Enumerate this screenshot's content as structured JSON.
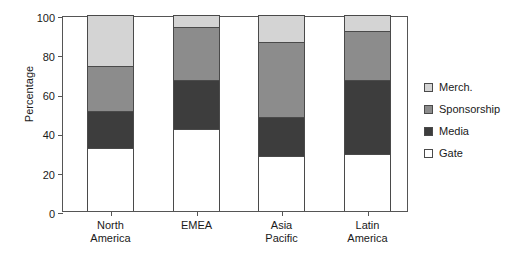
{
  "chart_data": {
    "type": "bar",
    "subtype": "stacked-bar",
    "title": "",
    "xlabel": "",
    "ylabel": "Percentage",
    "ylim": [
      0,
      100
    ],
    "yticks": [
      0,
      20,
      40,
      60,
      80,
      100
    ],
    "ytick_labels": [
      "0",
      "20",
      "40",
      "60",
      "80",
      "100"
    ],
    "grid": false,
    "legend_position": "right",
    "categories": [
      "North America",
      "EMEA",
      "Asia Pacific",
      "Latin America"
    ],
    "category_lines": [
      [
        "North",
        "America"
      ],
      [
        "EMEA",
        ""
      ],
      [
        "Asia",
        "Pacific"
      ],
      [
        "Latin",
        "America"
      ]
    ],
    "stack_order_bottom_to_top": [
      "Gate",
      "Media",
      "Sponsorship",
      "Merch."
    ],
    "series": [
      {
        "name": "Gate",
        "color": "#ffffff",
        "values": [
          32,
          42,
          28,
          29
        ]
      },
      {
        "name": "Media",
        "color": "#3d3d3d",
        "values": [
          19,
          25,
          20,
          38
        ]
      },
      {
        "name": "Sponsorship",
        "color": "#8c8c8c",
        "values": [
          23,
          27,
          38,
          25
        ]
      },
      {
        "name": "Merch.",
        "color": "#d4d4d4",
        "values": [
          26,
          6,
          14,
          8
        ]
      }
    ],
    "cumulative_tops": {
      "North America": {
        "Gate": 32,
        "Media": 51,
        "Sponsorship": 74,
        "Merch.": 100
      },
      "EMEA": {
        "Gate": 42,
        "Media": 67,
        "Sponsorship": 94,
        "Merch.": 100
      },
      "Asia Pacific": {
        "Gate": 28,
        "Media": 48,
        "Sponsorship": 86,
        "Merch.": 100
      },
      "Latin America": {
        "Gate": 29,
        "Media": 67,
        "Sponsorship": 92,
        "Merch.": 100
      }
    },
    "legend_entries": [
      {
        "label": "Merch.",
        "color": "#d4d4d4"
      },
      {
        "label": "Sponsorship",
        "color": "#8c8c8c"
      },
      {
        "label": "Media",
        "color": "#3d3d3d"
      },
      {
        "label": "Gate",
        "color": "#ffffff"
      }
    ],
    "colors": {
      "merch": "#d4d4d4",
      "sponsorship": "#8c8c8c",
      "media": "#3d3d3d",
      "gate": "#ffffff",
      "axis": "#555555",
      "text": "#1a1a1a",
      "bar_outline": "#4a4a4a",
      "background": "#ffffff"
    }
  }
}
